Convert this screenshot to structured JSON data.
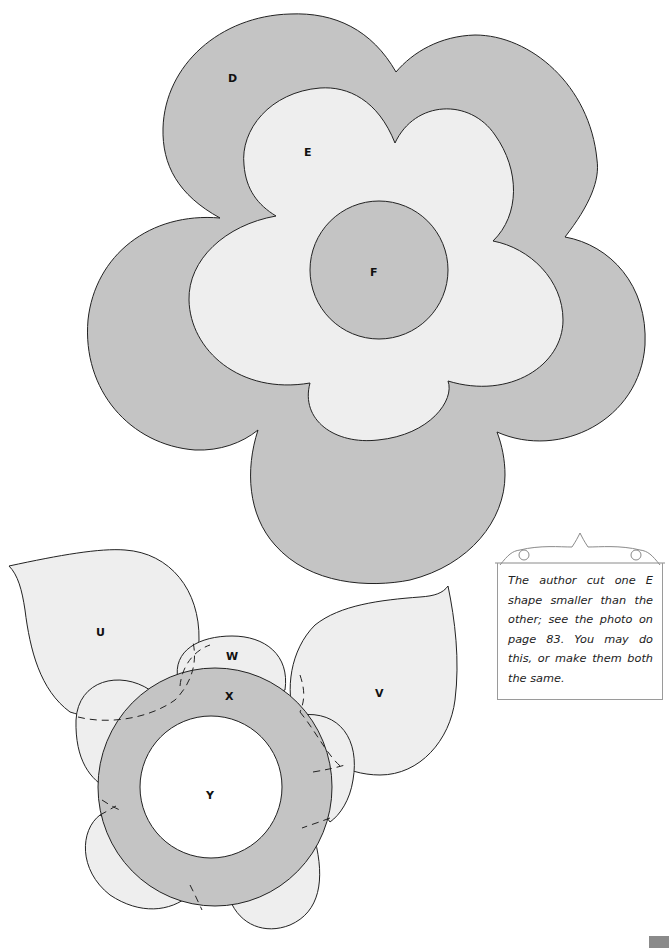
{
  "pattern": {
    "large_flower": {
      "labels": {
        "outer": "D",
        "middle": "E",
        "center": "F"
      },
      "colors": {
        "outer_fill": "#c4c4c4",
        "middle_fill": "#eeeeee",
        "center_fill": "#c4c4c4",
        "stroke": "#222222"
      }
    },
    "small_flower": {
      "labels": {
        "leaf_left": "U",
        "leaf_right": "V",
        "petals": "W",
        "ring": "X",
        "center": "Y"
      },
      "colors": {
        "leaf_fill": "#eeeeee",
        "petal_fill": "#eeeeee",
        "ring_fill": "#c4c4c4",
        "center_fill": "#ffffff"
      }
    }
  },
  "note": {
    "text": "The author cut one E shape smaller than the other; see the photo on page 83. You may do this, or make them both the same."
  },
  "page_tab": {
    "color": "#8a8a8a"
  }
}
